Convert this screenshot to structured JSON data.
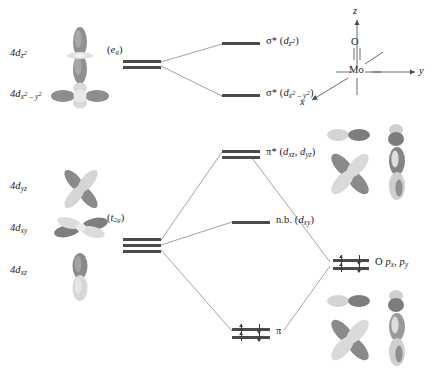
{
  "diagram": {
    "metal_center": "Mo",
    "ligand_atom": "O"
  },
  "axes": {
    "z": "z",
    "y": "y",
    "x": "x",
    "metal": "Mo",
    "oxygen": "O"
  },
  "metal_orbitals": [
    {
      "label_prefix": "4d",
      "sub": "z",
      "sup": "2",
      "name": "4d z2",
      "kind": "dz2"
    },
    {
      "label_prefix": "4d",
      "sub": "x",
      "sup": "2",
      "sub2": "y",
      "sup2": "2",
      "name": "4d x2-y2",
      "kind": "dx2y2"
    },
    {
      "label_prefix": "4d",
      "sub": "yz",
      "name": "4d yz",
      "kind": "clover"
    },
    {
      "label_prefix": "4d",
      "sub": "xy",
      "name": "4d xy",
      "kind": "clover_flat"
    },
    {
      "label_prefix": "4d",
      "sub": "xz",
      "name": "4d xz",
      "kind": "dumbbell"
    }
  ],
  "symmetry_groups": {
    "upper": "(e",
    "upper_sub": "g",
    "upper_close": ")",
    "lower": "(t",
    "lower_sub": "2g",
    "lower_close": ")"
  },
  "mo_levels": [
    {
      "id": "sigma_star_dz2",
      "symbol": "σ*",
      "orbital": "d",
      "sub": "z",
      "sup": "2",
      "text": "σ* (d z2)",
      "electrons": 0
    },
    {
      "id": "sigma_star_dx2y2",
      "symbol": "σ*",
      "orbital": "d",
      "sub": "x",
      "sup": "2",
      "sub2": "y",
      "sup2": "2",
      "text": "σ* (d x2-y2)",
      "electrons": 0
    },
    {
      "id": "pi_star",
      "symbol": "π*",
      "orbital": "d",
      "sub": "xz, d",
      "sub2": "yz",
      "text": "π* (d xz, d yz)",
      "electrons": 0
    },
    {
      "id": "nonbonding",
      "symbol": "n.b.",
      "orbital": "d",
      "sub": "xy",
      "text": "n.b. (d xy)",
      "electrons": 0
    },
    {
      "id": "pi_bonding",
      "symbol": "π",
      "text": "π",
      "electrons": 4
    }
  ],
  "labels": {
    "sigma": "σ*",
    "pi_star": "π*",
    "pi": "π",
    "nb": "n.b.",
    "d": "d",
    "four_d": "4d",
    "open_paren": "(",
    "close_paren": ")",
    "comma": ",",
    "minus": "–",
    "oxygen_p": "O p",
    "o_px_sub": "x",
    "o_py": ", p",
    "o_py_sub": "y"
  },
  "ligand_levels": {
    "label": "O p x , p y",
    "count": 2,
    "electrons_per_level": 2
  },
  "colors": {
    "bar": "#4a4a4a",
    "line": "#6e6e6e",
    "lobe_dark": "#8a8a8a",
    "lobe_light": "#d8d8d8",
    "text": "#1a1a1a"
  }
}
